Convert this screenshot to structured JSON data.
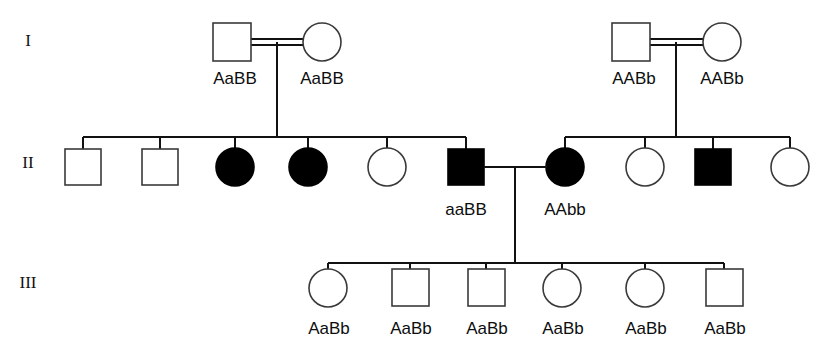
{
  "figure": {
    "type": "pedigree-chart",
    "title": "",
    "width": 838,
    "height": 353,
    "background": "#ffffff",
    "line_color": "#111111",
    "open_symbol_fill": "#ffffff",
    "filled_symbol_fill": "#000000",
    "symbol_stroke": "#3a3a3a"
  },
  "generation_labels": [
    {
      "text": "I",
      "x": 28,
      "y": 42
    },
    {
      "text": "II",
      "x": 28,
      "y": 163
    },
    {
      "text": "III",
      "x": 28,
      "y": 283
    }
  ],
  "generations": {
    "I": {
      "label": "I",
      "y": 42,
      "individuals": [
        {
          "id": "I-1",
          "sex": "male",
          "shape": "square",
          "affected": false,
          "cx": 232,
          "cy": 42,
          "genotype": "AaBB",
          "label_x": 235,
          "label_y": 83
        },
        {
          "id": "I-2",
          "sex": "female",
          "shape": "circle",
          "affected": false,
          "cx": 322,
          "cy": 42,
          "genotype": "AaBB",
          "label_x": 322,
          "label_y": 83
        },
        {
          "id": "I-3",
          "sex": "male",
          "shape": "square",
          "affected": false,
          "cx": 631,
          "cy": 42,
          "genotype": "AABb",
          "label_x": 634,
          "label_y": 83
        },
        {
          "id": "I-4",
          "sex": "female",
          "shape": "circle",
          "affected": false,
          "cx": 722,
          "cy": 42,
          "genotype": "AABb",
          "label_x": 722,
          "label_y": 83
        }
      ],
      "matings": [
        {
          "id": "mating-I-A",
          "partners": [
            "I-1",
            "I-2"
          ],
          "consanguineous": true,
          "x1": 252,
          "x2": 303,
          "y": 42,
          "drop_x": 277,
          "drop_to": 137
        },
        {
          "id": "mating-I-B",
          "partners": [
            "I-3",
            "I-4"
          ],
          "consanguineous": true,
          "x1": 650,
          "x2": 703,
          "y": 42,
          "drop_x": 676,
          "drop_to": 137
        }
      ]
    },
    "II": {
      "label": "II",
      "y": 167,
      "individuals": [
        {
          "id": "II-1",
          "sex": "male",
          "shape": "square",
          "affected": false,
          "cx": 83,
          "cy": 167,
          "genotype": "",
          "label_x": 83,
          "label_y": 208
        },
        {
          "id": "II-2",
          "sex": "male",
          "shape": "square",
          "affected": false,
          "cx": 160,
          "cy": 167,
          "genotype": "",
          "label_x": 160,
          "label_y": 208
        },
        {
          "id": "II-3",
          "sex": "female",
          "shape": "circle",
          "affected": true,
          "cx": 235,
          "cy": 167,
          "genotype": "",
          "label_x": 235,
          "label_y": 208
        },
        {
          "id": "II-4",
          "sex": "female",
          "shape": "circle",
          "affected": true,
          "cx": 308,
          "cy": 167,
          "genotype": "",
          "label_x": 308,
          "label_y": 208
        },
        {
          "id": "II-5",
          "sex": "female",
          "shape": "circle",
          "affected": false,
          "cx": 387,
          "cy": 167,
          "genotype": "",
          "label_x": 387,
          "label_y": 208
        },
        {
          "id": "II-6",
          "sex": "male",
          "shape": "square",
          "affected": true,
          "cx": 466,
          "cy": 167,
          "genotype": "aaBB",
          "label_x": 466,
          "label_y": 214
        },
        {
          "id": "II-7",
          "sex": "female",
          "shape": "circle",
          "affected": true,
          "cx": 565,
          "cy": 167,
          "genotype": "AAbb",
          "label_x": 565,
          "label_y": 214
        },
        {
          "id": "II-8",
          "sex": "female",
          "shape": "circle",
          "affected": false,
          "cx": 645,
          "cy": 167,
          "genotype": "",
          "label_x": 645,
          "label_y": 208
        },
        {
          "id": "II-9",
          "sex": "male",
          "shape": "square",
          "affected": true,
          "cx": 713,
          "cy": 167,
          "genotype": "",
          "label_x": 713,
          "label_y": 208
        },
        {
          "id": "II-10",
          "sex": "female",
          "shape": "circle",
          "affected": false,
          "cx": 790,
          "cy": 167,
          "genotype": "",
          "label_x": 790,
          "label_y": 208
        }
      ],
      "sibship_left": {
        "id": "sibship-II-left",
        "parents": "mating-I-A",
        "bar_y": 137,
        "bar_x1": 83,
        "bar_x2": 466,
        "children": [
          "II-1",
          "II-2",
          "II-3",
          "II-4",
          "II-5",
          "II-6"
        ]
      },
      "sibship_right": {
        "id": "sibship-II-right",
        "parents": "mating-I-B",
        "bar_y": 137,
        "bar_x1": 565,
        "bar_x2": 790,
        "children": [
          "II-7",
          "II-8",
          "II-9",
          "II-10"
        ]
      },
      "matings": [
        {
          "id": "mating-II-A",
          "partners": [
            "II-6",
            "II-7"
          ],
          "consanguineous": false,
          "x1": 484,
          "x2": 546,
          "y": 167,
          "drop_x": 515,
          "drop_to": 263
        }
      ]
    },
    "III": {
      "label": "III",
      "y": 287,
      "individuals": [
        {
          "id": "III-1",
          "sex": "female",
          "shape": "circle",
          "affected": false,
          "cx": 328,
          "cy": 287,
          "genotype": "AaBb",
          "label_x": 328,
          "label_y": 333
        },
        {
          "id": "III-2",
          "sex": "male",
          "shape": "square",
          "affected": false,
          "cx": 410,
          "cy": 287,
          "genotype": "AaBb",
          "label_x": 410,
          "label_y": 333
        },
        {
          "id": "III-3",
          "sex": "male",
          "shape": "square",
          "affected": false,
          "cx": 486,
          "cy": 287,
          "genotype": "AaBb",
          "label_x": 486,
          "label_y": 333
        },
        {
          "id": "III-4",
          "sex": "female",
          "shape": "circle",
          "affected": false,
          "cx": 562,
          "cy": 287,
          "genotype": "AaBb",
          "label_x": 562,
          "label_y": 333
        },
        {
          "id": "III-5",
          "sex": "female",
          "shape": "circle",
          "affected": false,
          "cx": 645,
          "cy": 287,
          "genotype": "AaBb",
          "label_x": 645,
          "label_y": 333
        },
        {
          "id": "III-6",
          "sex": "male",
          "shape": "square",
          "affected": false,
          "cx": 724,
          "cy": 287,
          "genotype": "AaBb",
          "label_x": 724,
          "label_y": 333
        }
      ],
      "sibship": {
        "id": "sibship-III",
        "parents": "mating-II-A",
        "bar_y": 263,
        "bar_x1": 328,
        "bar_x2": 724,
        "children": [
          "III-1",
          "III-2",
          "III-3",
          "III-4",
          "III-5",
          "III-6"
        ]
      }
    }
  },
  "geometry": {
    "square_size": 37,
    "circle_radius": 19,
    "double_line_gap": 5
  }
}
